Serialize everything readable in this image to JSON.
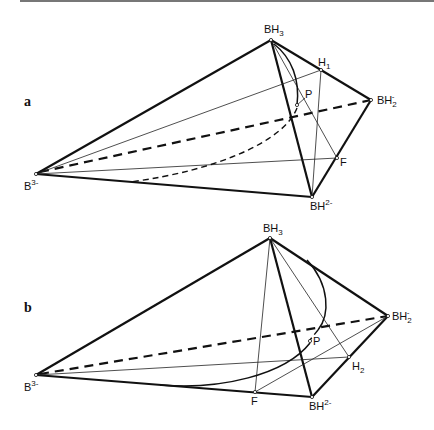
{
  "figure": {
    "panels": [
      {
        "id": "a",
        "label": "a",
        "vertices": {
          "B3": {
            "text": "B",
            "sup": "3-"
          },
          "BH3": {
            "text": "BH",
            "sub": "3"
          },
          "H1": {
            "text": "H",
            "sub": "1"
          },
          "BH2": {
            "text": "BH",
            "sub": "2",
            "sup": "-"
          },
          "F": {
            "text": "F"
          },
          "BH": {
            "text": "BH",
            "sup": "2-"
          },
          "P": {
            "text": "P"
          }
        }
      },
      {
        "id": "b",
        "label": "b",
        "vertices": {
          "B3": {
            "text": "B",
            "sup": "3-"
          },
          "BH3": {
            "text": "BH",
            "sub": "3"
          },
          "BH2": {
            "text": "BH",
            "sub": "2",
            "sup": "-"
          },
          "H2": {
            "text": "H",
            "sub": "2"
          },
          "F": {
            "text": "F"
          },
          "BH": {
            "text": "BH",
            "sup": "2-"
          },
          "P": {
            "text": "P"
          }
        }
      }
    ]
  }
}
